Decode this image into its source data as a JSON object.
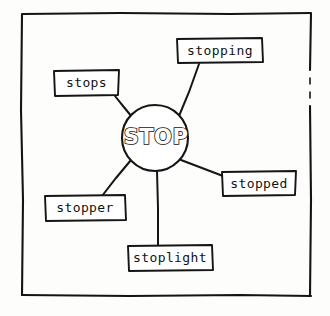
{
  "diagram": {
    "type": "word-web",
    "center": {
      "id": "center-node",
      "label": "STOP",
      "shape": "circle",
      "cx": 155,
      "cy": 138,
      "r": 33,
      "text_color": "#ffffff",
      "outline_color": "#111111"
    },
    "style": {
      "ink": "#141414",
      "paper": "#fdfdfb",
      "border_color": "#141414"
    },
    "nodes": [
      {
        "id": "node-stopping",
        "label": "stopping",
        "x": 177,
        "y": 38,
        "w": 86,
        "h": 25,
        "text_x": 220,
        "text_y": 51,
        "line": {
          "x1": 179,
          "y1": 116,
          "x2": 199,
          "y2": 63
        }
      },
      {
        "id": "node-stops",
        "label": "stops",
        "x": 54,
        "y": 70,
        "w": 65,
        "h": 26,
        "text_x": 87,
        "text_y": 83,
        "line": {
          "x1": 132,
          "y1": 117,
          "x2": 115,
          "y2": 96
        }
      },
      {
        "id": "node-stopped",
        "label": "stopped",
        "x": 222,
        "y": 171,
        "w": 74,
        "h": 24,
        "text_x": 259,
        "text_y": 183,
        "line": {
          "x1": 181,
          "y1": 160,
          "x2": 222,
          "y2": 175
        }
      },
      {
        "id": "node-stopper",
        "label": "stopper",
        "x": 45,
        "y": 195,
        "w": 80,
        "h": 25,
        "text_x": 85,
        "text_y": 208,
        "line": {
          "x1": 131,
          "y1": 160,
          "x2": 102,
          "y2": 195
        }
      },
      {
        "id": "node-stoplight",
        "label": "stoplight",
        "x": 128,
        "y": 245,
        "w": 84,
        "h": 25,
        "text_x": 170,
        "text_y": 258,
        "line": {
          "x1": 157,
          "y1": 171,
          "x2": 158,
          "y2": 245
        }
      }
    ],
    "frame": {
      "left": 22,
      "top": 13,
      "right": 311,
      "bottom": 296
    }
  }
}
